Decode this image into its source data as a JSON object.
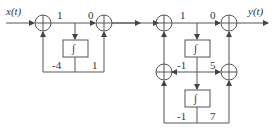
{
  "signals": {
    "input": "x(t)",
    "output": "y(t)"
  },
  "left_section": {
    "gain_top_1": "1",
    "gain_top_2": "0",
    "gain_bottom_left": "-4",
    "gain_bottom_right": "1",
    "integrator": "∫"
  },
  "right_section": {
    "gain_top_1": "1",
    "gain_top_2": "0",
    "gain_mid_left": "-1",
    "gain_mid_right": "5",
    "gain_bottom_left": "-1",
    "gain_bottom_right": "7",
    "integrator_1": "∫",
    "integrator_2": "∫"
  },
  "colors": {
    "line": "#555555",
    "text": "#333333"
  }
}
